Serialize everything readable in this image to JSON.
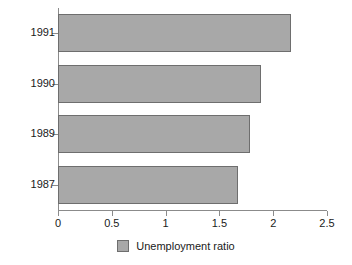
{
  "chart_data": {
    "type": "bar",
    "orientation": "horizontal",
    "title": "",
    "xlabel": "",
    "ylabel": "",
    "categories": [
      "1991",
      "1990",
      "1989",
      "1987"
    ],
    "values": [
      2.17,
      1.89,
      1.78,
      1.67
    ],
    "series": [
      {
        "name": "Unemployment ratio",
        "values": [
          2.17,
          1.89,
          1.78,
          1.67
        ],
        "color": "#a8a8a8"
      }
    ],
    "xlim": [
      0,
      2.5
    ],
    "xticks": [
      0,
      0.5,
      1,
      1.5,
      2,
      2.5
    ],
    "xtick_labels": [
      "0",
      "0.5",
      "1",
      "1.5",
      "2",
      "2.5"
    ],
    "ytick_labels": [
      "1991",
      "1990",
      "1989",
      "1987"
    ],
    "grid": false,
    "legend": {
      "position": "bottom-center",
      "entries": [
        {
          "label": "Unemployment ratio",
          "color": "#a8a8a8"
        }
      ]
    },
    "colors": {
      "bar_fill": "#a8a8a8",
      "bar_border": "#6e6e6e",
      "axis": "#8b8b8b",
      "text": "#1a1a1a",
      "background": "#ffffff"
    }
  }
}
